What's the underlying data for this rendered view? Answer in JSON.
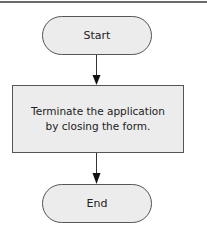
{
  "diagram": {
    "type": "flowchart",
    "nodes": [
      {
        "id": "start",
        "shape": "terminal",
        "label": "Start"
      },
      {
        "id": "terminate",
        "shape": "process",
        "label_lines": [
          "Terminate the application",
          "by closing the form."
        ]
      },
      {
        "id": "end",
        "shape": "terminal",
        "label": "End"
      }
    ],
    "edges": [
      {
        "from": "start",
        "to": "terminate"
      },
      {
        "from": "terminate",
        "to": "end"
      }
    ],
    "colors": {
      "fill": "#ececec",
      "stroke": "#555555",
      "text": "#222222",
      "top_rule": "#6a6a6a"
    }
  }
}
